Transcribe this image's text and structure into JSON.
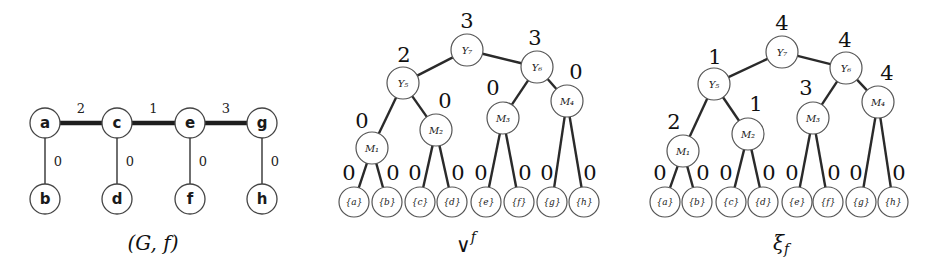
{
  "graph": {
    "caption": "(G, f)",
    "nodes": [
      {
        "id": "a",
        "label": "a",
        "x": 45,
        "y": 123
      },
      {
        "id": "c",
        "label": "c",
        "x": 117,
        "y": 123
      },
      {
        "id": "e",
        "label": "e",
        "x": 190,
        "y": 123
      },
      {
        "id": "g",
        "label": "g",
        "x": 262,
        "y": 123
      },
      {
        "id": "b",
        "label": "b",
        "x": 45,
        "y": 199
      },
      {
        "id": "d",
        "label": "d",
        "x": 117,
        "y": 199
      },
      {
        "id": "f",
        "label": "f",
        "x": 190,
        "y": 199
      },
      {
        "id": "h",
        "label": "h",
        "x": 262,
        "y": 199
      }
    ],
    "edges": [
      {
        "from": "a",
        "to": "c",
        "weight": "2",
        "thick": true
      },
      {
        "from": "c",
        "to": "e",
        "weight": "1",
        "thick": true
      },
      {
        "from": "e",
        "to": "g",
        "weight": "3",
        "thick": true
      },
      {
        "from": "a",
        "to": "b",
        "weight": "0",
        "thick": false
      },
      {
        "from": "c",
        "to": "d",
        "weight": "0",
        "thick": false
      },
      {
        "from": "e",
        "to": "f",
        "weight": "0",
        "thick": false
      },
      {
        "from": "g",
        "to": "h",
        "weight": "0",
        "thick": false
      }
    ]
  },
  "trees": [
    {
      "id": "vee-f",
      "caption": "∨",
      "caption_sup": "f",
      "caption_pos": {
        "x": 466,
        "y": 245
      },
      "internal": [
        {
          "id": "Y7",
          "label": "Y₇",
          "x": 467,
          "y": 50,
          "value": "3",
          "vx": 467,
          "vy": 21
        },
        {
          "id": "Y5",
          "label": "Y₅",
          "x": 403,
          "y": 83,
          "value": "2",
          "vx": 404,
          "vy": 55
        },
        {
          "id": "Y6",
          "label": "Y₆",
          "x": 537,
          "y": 67,
          "value": "3",
          "vx": 535,
          "vy": 38
        },
        {
          "id": "M1",
          "label": "M₁",
          "x": 372,
          "y": 148,
          "value": "0",
          "vx": 362,
          "vy": 121
        },
        {
          "id": "M2",
          "label": "M₂",
          "x": 436,
          "y": 130,
          "value": "0",
          "vx": 445,
          "vy": 101
        },
        {
          "id": "M3",
          "label": "M₃",
          "x": 503,
          "y": 118,
          "value": "0",
          "vx": 493,
          "vy": 88
        },
        {
          "id": "M4",
          "label": "M₄",
          "x": 567,
          "y": 101,
          "value": "0",
          "vx": 576,
          "vy": 72
        }
      ],
      "leaves": [
        {
          "label": "{a}",
          "x": 354,
          "value": "0",
          "side": "L"
        },
        {
          "label": "{b}",
          "x": 387,
          "value": "0",
          "side": "R"
        },
        {
          "label": "{c}",
          "x": 420,
          "value": "0",
          "side": "L"
        },
        {
          "label": "{d}",
          "x": 452,
          "value": "0",
          "side": "R"
        },
        {
          "label": "{e}",
          "x": 486,
          "value": "0",
          "side": "L"
        },
        {
          "label": "{f}",
          "x": 519,
          "value": "0",
          "side": "R"
        },
        {
          "label": "{g}",
          "x": 552,
          "value": "0",
          "side": "L"
        },
        {
          "label": "{h}",
          "x": 584,
          "value": "0",
          "side": "R"
        }
      ],
      "edges": [
        [
          "Y7",
          "Y5"
        ],
        [
          "Y7",
          "Y6"
        ],
        [
          "Y5",
          "M1"
        ],
        [
          "Y5",
          "M2"
        ],
        [
          "Y6",
          "M3"
        ],
        [
          "Y6",
          "M4"
        ],
        [
          "M1",
          0
        ],
        [
          "M1",
          1
        ],
        [
          "M2",
          2
        ],
        [
          "M2",
          3
        ],
        [
          "M3",
          4
        ],
        [
          "M3",
          5
        ],
        [
          "M4",
          6
        ],
        [
          "M4",
          7
        ]
      ]
    },
    {
      "id": "xi-f",
      "caption": "ξ",
      "caption_sup": "f",
      "caption_pos": {
        "x": 781,
        "y": 243
      },
      "internal": [
        {
          "id": "Y7",
          "label": "Y₇",
          "x": 782,
          "y": 52,
          "value": "4",
          "vx": 782,
          "vy": 23
        },
        {
          "id": "Y5",
          "label": "Y₅",
          "x": 714,
          "y": 84,
          "value": "1",
          "vx": 715,
          "vy": 57
        },
        {
          "id": "Y6",
          "label": "Y₆",
          "x": 846,
          "y": 68,
          "value": "4",
          "vx": 845,
          "vy": 40
        },
        {
          "id": "M1",
          "label": "M₁",
          "x": 683,
          "y": 151,
          "value": "2",
          "vx": 674,
          "vy": 122
        },
        {
          "id": "M2",
          "label": "M₂",
          "x": 748,
          "y": 134,
          "value": "1",
          "vx": 756,
          "vy": 104
        },
        {
          "id": "M3",
          "label": "M₃",
          "x": 813,
          "y": 118,
          "value": "3",
          "vx": 806,
          "vy": 88
        },
        {
          "id": "M4",
          "label": "M₄",
          "x": 878,
          "y": 102,
          "value": "4",
          "vx": 887,
          "vy": 73
        }
      ],
      "leaves": [
        {
          "label": "{a}",
          "x": 665,
          "value": "0",
          "side": "L"
        },
        {
          "label": "{b}",
          "x": 697,
          "value": "0",
          "side": "R"
        },
        {
          "label": "{c}",
          "x": 731,
          "value": "0",
          "side": "L"
        },
        {
          "label": "{d}",
          "x": 763,
          "value": "0",
          "side": "R"
        },
        {
          "label": "{e}",
          "x": 797,
          "value": "0",
          "side": "L"
        },
        {
          "label": "{f}",
          "x": 828,
          "value": "0",
          "side": "R"
        },
        {
          "label": "{g}",
          "x": 861,
          "value": "0",
          "side": "L"
        },
        {
          "label": "{h}",
          "x": 893,
          "value": "0",
          "side": "R"
        }
      ],
      "edges": [
        [
          "Y7",
          "Y5"
        ],
        [
          "Y7",
          "Y6"
        ],
        [
          "Y5",
          "M1"
        ],
        [
          "Y5",
          "M2"
        ],
        [
          "Y6",
          "M3"
        ],
        [
          "Y6",
          "M4"
        ],
        [
          "M1",
          0
        ],
        [
          "M1",
          1
        ],
        [
          "M2",
          2
        ],
        [
          "M2",
          3
        ],
        [
          "M3",
          4
        ],
        [
          "M3",
          5
        ],
        [
          "M4",
          6
        ],
        [
          "M4",
          7
        ]
      ]
    }
  ]
}
